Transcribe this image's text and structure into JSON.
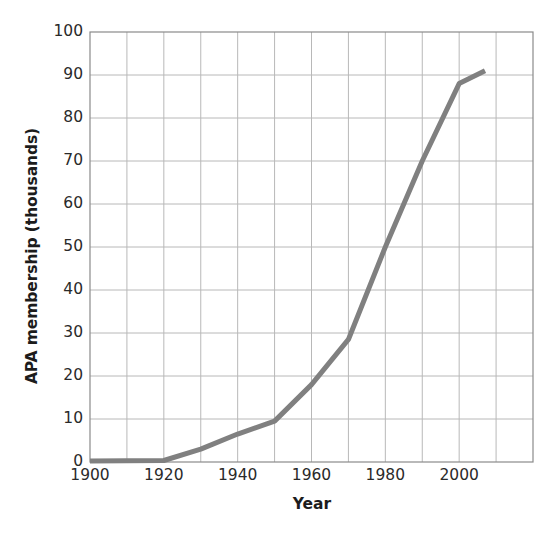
{
  "chart_data": {
    "type": "line",
    "title": "",
    "xlabel": "Year",
    "ylabel": "APA membership (thousands)",
    "xlim": [
      1900,
      2020
    ],
    "ylim": [
      0,
      100
    ],
    "xticks": [
      "1900",
      "1920",
      "1940",
      "1960",
      "1980",
      "2000"
    ],
    "xtick_values": [
      1900,
      1920,
      1940,
      1960,
      1980,
      2000
    ],
    "yticks": [
      "0",
      "10",
      "20",
      "30",
      "40",
      "50",
      "60",
      "70",
      "80",
      "90",
      "100"
    ],
    "ytick_values": [
      0,
      10,
      20,
      30,
      40,
      50,
      60,
      70,
      80,
      90,
      100
    ],
    "grid": true,
    "grid_x_step": 10,
    "grid_y_step": 10,
    "legend": "none",
    "series": [
      {
        "name": "APA membership",
        "color": "#808080",
        "line_width": 5,
        "x": [
          1900,
          1910,
          1920,
          1930,
          1940,
          1950,
          1960,
          1970,
          1980,
          1990,
          2000,
          2007
        ],
        "y": [
          0.25,
          0.3,
          0.35,
          3,
          6.5,
          9.5,
          18,
          28.5,
          50,
          70,
          88,
          91
        ]
      }
    ]
  },
  "axes": {
    "plot_area": {
      "left_px": 90,
      "right_px": 533,
      "top_px": 32,
      "bottom_px": 462
    },
    "border_color": "#8a8a8a",
    "grid_color": "#b8b8b8",
    "text_color": "#2a2a2a",
    "background": "#ffffff"
  }
}
